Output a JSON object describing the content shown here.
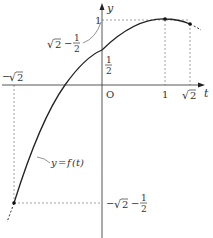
{
  "diagram": {
    "type": "function-graph",
    "axes": {
      "x_label": "t",
      "y_label": "y",
      "origin_label": "O"
    },
    "x_ticks": [
      {
        "value": "1",
        "label": "1"
      },
      {
        "value": "sqrt2",
        "label_radicand": "2"
      },
      {
        "value": "-sqrt2",
        "label_sign": "−",
        "label_radicand": "2"
      }
    ],
    "y_ticks": [
      {
        "value": "1",
        "label": "1"
      },
      {
        "value": "1/2",
        "num": "1",
        "den": "2"
      },
      {
        "value": "sqrt2 - 1/2",
        "radicand": "2",
        "minus": "−",
        "num": "1",
        "den": "2"
      },
      {
        "value": "-sqrt2 - 1/2",
        "sign": "−",
        "radicand": "2",
        "minus": "−",
        "num": "1",
        "den": "2"
      }
    ],
    "curve_label": {
      "text_y": "y",
      "text_eq": "=",
      "text_f": "f",
      "text_paren": "(t)"
    },
    "colors": {
      "curve": "#222222",
      "axis": "#444444",
      "dashed": "#888888",
      "text": "#333333"
    }
  }
}
